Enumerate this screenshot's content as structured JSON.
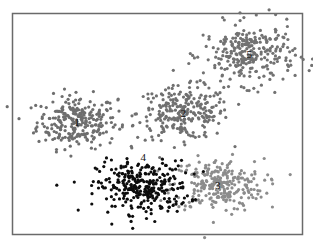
{
  "chart_data": {
    "type": "scatter",
    "title": "",
    "xlabel": "",
    "ylabel": "",
    "xlim": [
      0,
      100
    ],
    "ylim": [
      0,
      100
    ],
    "grid": false,
    "legend": "none",
    "clusters": [
      {
        "name": "1",
        "label": "1",
        "center": [
          22,
          51
        ],
        "spread": [
          7,
          6
        ],
        "count": 260,
        "color": "#6e6e6e"
      },
      {
        "name": "2",
        "label": "2",
        "center": [
          59,
          55
        ],
        "spread": [
          8,
          6
        ],
        "count": 260,
        "color": "#707070"
      },
      {
        "name": "3",
        "label": "3",
        "center": [
          71,
          22
        ],
        "spread": [
          8,
          6
        ],
        "count": 260,
        "color": "#8c8c8c"
      },
      {
        "name": "4",
        "label": "4",
        "center": [
          45,
          21
        ],
        "spread": [
          8,
          6
        ],
        "count": 300,
        "color": "#0d0d0d",
        "label_offset": [
          0,
          14
        ]
      },
      {
        "name": "5",
        "label": "5",
        "center": [
          82,
          82
        ],
        "spread": [
          8,
          7
        ],
        "count": 280,
        "color": "#727272"
      }
    ]
  }
}
